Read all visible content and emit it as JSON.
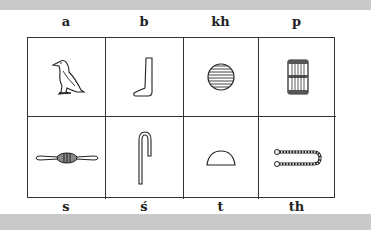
{
  "top_labels": [
    "a",
    "b",
    "kh",
    "p"
  ],
  "bottom_labels": [
    "s",
    "ś",
    "t",
    "th"
  ],
  "glyphs": [
    {
      "sound": "a",
      "icon": "vulture-icon"
    },
    {
      "sound": "b",
      "icon": "foot-icon"
    },
    {
      "sound": "kh",
      "icon": "placenta-icon"
    },
    {
      "sound": "p",
      "icon": "stool-icon"
    },
    {
      "sound": "s",
      "icon": "bolt-of-cloth-icon"
    },
    {
      "sound": "ś",
      "icon": "folded-cloth-icon"
    },
    {
      "sound": "t",
      "icon": "bread-loaf-icon"
    },
    {
      "sound": "th",
      "icon": "tethering-rope-icon"
    }
  ]
}
